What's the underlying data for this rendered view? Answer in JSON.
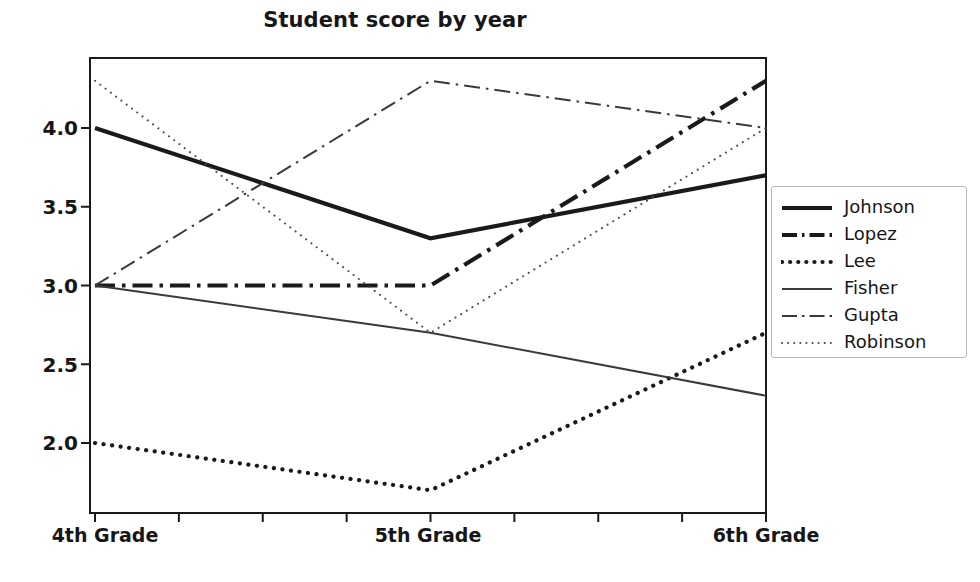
{
  "chart_data": {
    "type": "line",
    "title": "Student score by year",
    "xlabel": "",
    "ylabel": "",
    "categories": [
      "4th Grade",
      "5th Grade",
      "6th Grade"
    ],
    "x": [
      0,
      1,
      2
    ],
    "ylim": [
      1.6,
      4.45
    ],
    "yticks": [
      "2.0",
      "2.5",
      "3.0",
      "3.5",
      "4.0"
    ],
    "ytick_values": [
      2.0,
      2.5,
      3.0,
      3.5,
      4.0
    ],
    "grid": false,
    "legend_position": "right",
    "series": [
      {
        "name": "Johnson",
        "values": [
          4.0,
          3.3,
          3.7
        ],
        "style": "solid",
        "width": "thick",
        "color": "#1a1a1a"
      },
      {
        "name": "Lopez",
        "values": [
          3.0,
          3.0,
          4.3
        ],
        "style": "dash-dot",
        "width": "thick",
        "color": "#1a1a1a"
      },
      {
        "name": "Lee",
        "values": [
          2.0,
          1.7,
          2.7
        ],
        "style": "dotted",
        "width": "thick",
        "color": "#1a1a1a"
      },
      {
        "name": "Fisher",
        "values": [
          3.0,
          2.7,
          2.3
        ],
        "style": "solid",
        "width": "thin",
        "color": "#3a3a3a"
      },
      {
        "name": "Gupta",
        "values": [
          3.0,
          4.3,
          4.0
        ],
        "style": "dash-dot",
        "width": "thin",
        "color": "#3a3a3a"
      },
      {
        "name": "Robinson",
        "values": [
          4.3,
          2.7,
          4.0
        ],
        "style": "dotted",
        "width": "thin",
        "color": "#4a4a4a"
      }
    ]
  },
  "axis": {
    "ytick_labels": [
      "4.0",
      "3.5",
      "3.0",
      "2.5",
      "2.0"
    ],
    "xtick_labels": [
      "4th Grade",
      "5th Grade",
      "6th Grade"
    ]
  },
  "legend": {
    "items": [
      {
        "label": "Johnson"
      },
      {
        "label": "Lopez"
      },
      {
        "label": "Lee"
      },
      {
        "label": "Fisher"
      },
      {
        "label": "Gupta"
      },
      {
        "label": "Robinson"
      }
    ]
  }
}
